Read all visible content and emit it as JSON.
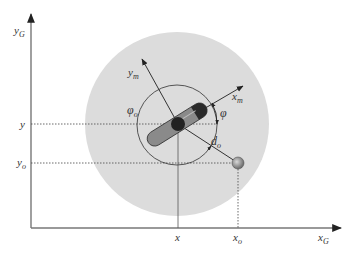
{
  "diagram": {
    "axes": {
      "y_label": "y",
      "y_sub": "G",
      "x_label": "x",
      "x_sub": "G"
    },
    "labels": {
      "y_tick": "y",
      "yo_tick": "y",
      "yo_sub": "o",
      "x_tick": "x",
      "xo_tick": "x",
      "xo_sub": "o",
      "ym": "y",
      "ym_sub": "m",
      "xm": "x",
      "xm_sub": "m",
      "phi": "φ",
      "phi_o": "φ",
      "phi_o_sub": "o",
      "d_o": "d",
      "d_o_sub": "o"
    },
    "colors": {
      "outer_region": "#dcdcdc",
      "robot_body": "#8a8a8a",
      "robot_head": "#2a2a2a",
      "robot_center": "#222222",
      "obstacle": "#9a9a9a",
      "lines": "#333333"
    }
  }
}
